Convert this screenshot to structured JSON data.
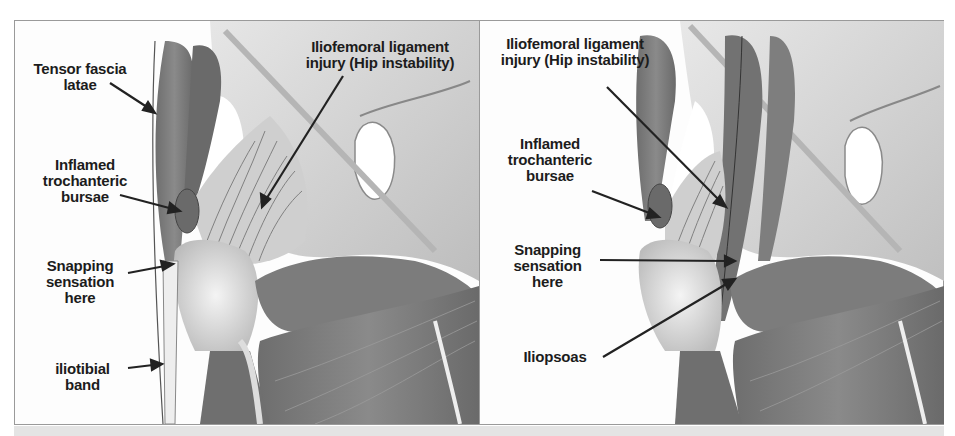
{
  "figure": {
    "panels": [
      {
        "id": "left",
        "labels": {
          "tensor": "Tensor fascia\nlatae",
          "iliofemoral": "Iliofemoral ligament\ninjury (Hip instability)",
          "bursae": "Inflamed\ntrochanteric\nbursae",
          "snapping": "Snapping\nsensation\nhere",
          "iliotibial": "iliotibial\nband"
        }
      },
      {
        "id": "right",
        "labels": {
          "iliofemoral": "Iliofemoral ligament\ninjury (Hip instability)",
          "bursae": "Inflamed\ntrochanteric\nbursae",
          "snapping": "Snapping\nsensation\nhere",
          "iliopsoas": "Iliopsoas"
        }
      }
    ],
    "colors": {
      "muscle": "#7a7a7a",
      "muscle_dark": "#5e5e5e",
      "bone": "#d4d4d4",
      "bone_light": "#e8e8e8",
      "ligament": "#c2c2c2",
      "text": "#1c1c1c"
    }
  }
}
